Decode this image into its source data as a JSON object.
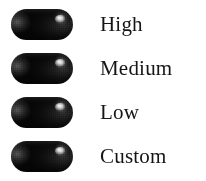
{
  "panel": {
    "background_color": "#ffffff",
    "label_color": "#151515"
  },
  "legend": {
    "items": [
      {
        "label": "High",
        "swatch": "gradient-pill-swatch",
        "swatch_start_color": "#d8d8d8",
        "swatch_end_color": "#0a0a0a"
      },
      {
        "label": "Medium",
        "swatch": "gradient-pill-swatch",
        "swatch_start_color": "#d8d8d8",
        "swatch_end_color": "#0a0a0a"
      },
      {
        "label": "Low",
        "swatch": "gradient-pill-swatch",
        "swatch_start_color": "#d8d8d8",
        "swatch_end_color": "#0a0a0a"
      },
      {
        "label": "Custom",
        "swatch": "gradient-pill-swatch",
        "swatch_start_color": "#d8d8d8",
        "swatch_end_color": "#0a0a0a"
      }
    ]
  }
}
